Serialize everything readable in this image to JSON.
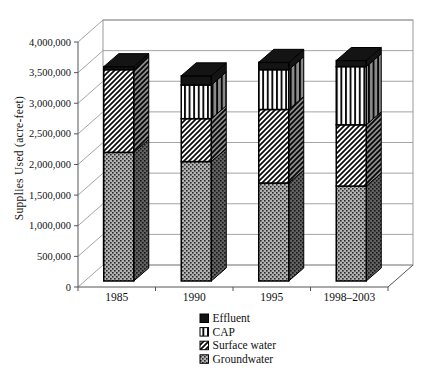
{
  "chart_data": {
    "type": "bar",
    "subtype": "stacked-3d-column",
    "title": "",
    "xlabel": "",
    "ylabel": "Supplies Used (acre-feet)",
    "categories": [
      "1985",
      "1990",
      "1995",
      "1998–2003"
    ],
    "series": [
      {
        "name": "Groundwater",
        "pattern": "dots-gray",
        "values": [
          2100000,
          1950000,
          1600000,
          1550000
        ]
      },
      {
        "name": "Surface water",
        "pattern": "diagonal-stripes",
        "values": [
          1350000,
          700000,
          1200000,
          1000000
        ]
      },
      {
        "name": "CAP",
        "pattern": "vertical-stripes",
        "values": [
          0,
          550000,
          650000,
          950000
        ]
      },
      {
        "name": "Effluent",
        "pattern": "solid-black",
        "values": [
          50000,
          150000,
          120000,
          100000
        ]
      }
    ],
    "totals": [
      3500000,
      3350000,
      3570000,
      3600000
    ],
    "stack_order": "bottom-to-top",
    "ylim": [
      0,
      4000000
    ],
    "ytick_step": 500000,
    "ytick_labels": [
      "0",
      "500,000",
      "1,000,000",
      "1,500,000",
      "2,000,000",
      "2,500,000",
      "3,000,000",
      "3,500,000",
      "4,000,000"
    ],
    "grid": true,
    "legend": {
      "position": "bottom-center",
      "order": [
        "Effluent",
        "CAP",
        "Surface water",
        "Groundwater"
      ]
    },
    "colors": {
      "background": "#ffffff",
      "ink": "#000000",
      "grid_line": "#9a9a9a",
      "axis_line": "#555555",
      "groundwater_gray": "#b3b3b3",
      "effluent_black": "#141414"
    }
  }
}
